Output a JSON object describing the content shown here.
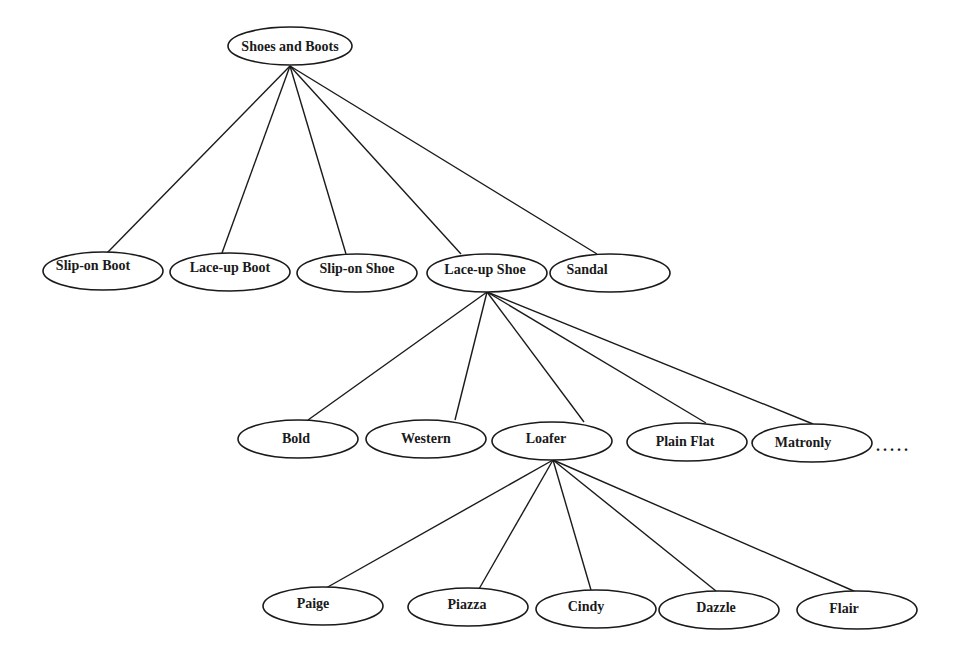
{
  "diagram": {
    "type": "tree",
    "title": "",
    "nodes": [
      {
        "id": "root",
        "label": "Shoes and Boots",
        "cx": 290,
        "cy": 46,
        "rx": 62,
        "ry": 19,
        "label_dx": 0,
        "parent": null
      },
      {
        "id": "slip-on-boot",
        "label": "Slip-on Boot",
        "cx": 103,
        "cy": 271,
        "rx": 60,
        "ry": 19,
        "label_dx": -10,
        "label_dy": -6,
        "parent": "root"
      },
      {
        "id": "lace-up-boot",
        "label": "Lace-up Boot",
        "cx": 230,
        "cy": 272,
        "rx": 60,
        "ry": 19,
        "label_dx": 0,
        "label_dy": -5,
        "parent": "root"
      },
      {
        "id": "slip-on-shoe",
        "label": "Slip-on Shoe",
        "cx": 357,
        "cy": 273,
        "rx": 60,
        "ry": 19,
        "label_dx": 0,
        "label_dy": -5,
        "parent": "root"
      },
      {
        "id": "lace-up-shoe",
        "label": "Lace-up Shoe",
        "cx": 487,
        "cy": 273,
        "rx": 60,
        "ry": 19,
        "label_dx": -2,
        "label_dy": -4,
        "parent": "root"
      },
      {
        "id": "sandal",
        "label": "Sandal",
        "cx": 610,
        "cy": 273,
        "rx": 60,
        "ry": 19,
        "label_dx": -23,
        "label_dy": -4,
        "parent": "root"
      },
      {
        "id": "bold",
        "label": "Bold",
        "cx": 298,
        "cy": 439,
        "rx": 60,
        "ry": 19,
        "label_dx": -2,
        "label_dy": -1,
        "parent": "lace-up-shoe"
      },
      {
        "id": "western",
        "label": "Western",
        "cx": 426,
        "cy": 439,
        "rx": 60,
        "ry": 19,
        "label_dx": 0,
        "label_dy": -1,
        "parent": "lace-up-shoe"
      },
      {
        "id": "loafer",
        "label": "Loafer",
        "cx": 552,
        "cy": 441,
        "rx": 60,
        "ry": 19,
        "label_dx": -6,
        "label_dy": -3,
        "parent": "lace-up-shoe"
      },
      {
        "id": "plain-flat",
        "label": "Plain Flat",
        "cx": 687,
        "cy": 442,
        "rx": 60,
        "ry": 19,
        "label_dx": -2,
        "label_dy": -1,
        "parent": "lace-up-shoe"
      },
      {
        "id": "matronly",
        "label": "Matronly",
        "cx": 812,
        "cy": 443,
        "rx": 60,
        "ry": 19,
        "label_dx": -9,
        "label_dy": -1,
        "parent": "lace-up-shoe"
      },
      {
        "id": "paige",
        "label": "Paige",
        "cx": 323,
        "cy": 606,
        "rx": 60,
        "ry": 19,
        "label_dx": -10,
        "label_dy": -3,
        "parent": "loafer"
      },
      {
        "id": "piazza",
        "label": "Piazza",
        "cx": 468,
        "cy": 607,
        "rx": 60,
        "ry": 19,
        "label_dx": -1,
        "label_dy": -3,
        "parent": "loafer"
      },
      {
        "id": "cindy",
        "label": "Cindy",
        "cx": 596,
        "cy": 609,
        "rx": 60,
        "ry": 19,
        "label_dx": -10,
        "label_dy": -3,
        "parent": "loafer"
      },
      {
        "id": "dazzle",
        "label": "Dazzle",
        "cx": 719,
        "cy": 610,
        "rx": 60,
        "ry": 19,
        "label_dx": -3,
        "label_dy": -3,
        "parent": "loafer"
      },
      {
        "id": "flair",
        "label": "Flair",
        "cx": 857,
        "cy": 610,
        "rx": 60,
        "ry": 19,
        "label_dx": -13,
        "label_dy": -2,
        "parent": "loafer"
      }
    ],
    "edges": [
      {
        "from": "root",
        "to": "slip-on-boot",
        "x1": 290,
        "y1": 66,
        "x2": 107,
        "y2": 253
      },
      {
        "from": "root",
        "to": "lace-up-boot",
        "x1": 290,
        "y1": 66,
        "x2": 222,
        "y2": 253
      },
      {
        "from": "root",
        "to": "slip-on-shoe",
        "x1": 290,
        "y1": 66,
        "x2": 346,
        "y2": 254
      },
      {
        "from": "root",
        "to": "lace-up-shoe",
        "x1": 290,
        "y1": 66,
        "x2": 461,
        "y2": 254
      },
      {
        "from": "root",
        "to": "sandal",
        "x1": 290,
        "y1": 66,
        "x2": 597,
        "y2": 254
      },
      {
        "from": "lace-up-shoe",
        "to": "bold",
        "x1": 487,
        "y1": 292,
        "x2": 308,
        "y2": 420
      },
      {
        "from": "lace-up-shoe",
        "to": "western",
        "x1": 487,
        "y1": 292,
        "x2": 455,
        "y2": 420
      },
      {
        "from": "lace-up-shoe",
        "to": "loafer",
        "x1": 487,
        "y1": 292,
        "x2": 584,
        "y2": 422
      },
      {
        "from": "lace-up-shoe",
        "to": "plain-flat",
        "x1": 487,
        "y1": 292,
        "x2": 706,
        "y2": 423
      },
      {
        "from": "lace-up-shoe",
        "to": "matronly",
        "x1": 487,
        "y1": 292,
        "x2": 813,
        "y2": 424
      },
      {
        "from": "loafer",
        "to": "paige",
        "x1": 553,
        "y1": 460,
        "x2": 326,
        "y2": 588
      },
      {
        "from": "loafer",
        "to": "piazza",
        "x1": 553,
        "y1": 460,
        "x2": 479,
        "y2": 589
      },
      {
        "from": "loafer",
        "to": "cindy",
        "x1": 553,
        "y1": 460,
        "x2": 591,
        "y2": 590
      },
      {
        "from": "loafer",
        "to": "dazzle",
        "x1": 553,
        "y1": 460,
        "x2": 716,
        "y2": 591
      },
      {
        "from": "loafer",
        "to": "flair",
        "x1": 553,
        "y1": 460,
        "x2": 856,
        "y2": 592
      }
    ],
    "continuation_marker": {
      "text": ".....",
      "x": 876,
      "y": 451
    }
  }
}
